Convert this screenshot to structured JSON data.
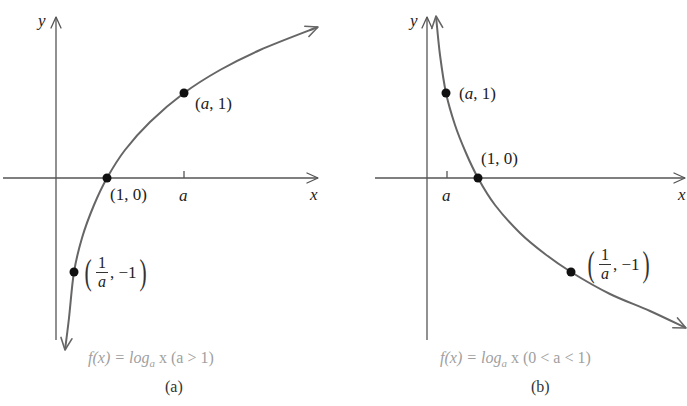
{
  "chart_data": [
    {
      "type": "line",
      "id": "a",
      "title": "f(x) = log_a x (a > 1)",
      "panel_label": "(a)",
      "xlabel": "x",
      "ylabel": "y",
      "x_tick_labels": [
        "a"
      ],
      "grid": false,
      "series": [
        {
          "name": "f(x) = log_a x",
          "description": "increasing logarithmic curve",
          "key_points": [
            {
              "label": "(1/a, -1)",
              "x": "1/a",
              "y": -1
            },
            {
              "label": "(1, 0)",
              "x": 1,
              "y": 0
            },
            {
              "label": "(a, 1)",
              "x": "a",
              "y": 1
            }
          ]
        }
      ]
    },
    {
      "type": "line",
      "id": "b",
      "title": "f(x) = log_a x (0 < a < 1)",
      "panel_label": "(b)",
      "xlabel": "x",
      "ylabel": "y",
      "x_tick_labels": [
        "a"
      ],
      "grid": false,
      "series": [
        {
          "name": "f(x) = log_a x",
          "description": "decreasing logarithmic curve",
          "key_points": [
            {
              "label": "(a, 1)",
              "x": "a",
              "y": 1
            },
            {
              "label": "(1, 0)",
              "x": 1,
              "y": 0
            },
            {
              "label": "(1/a, -1)",
              "x": "1/a",
              "y": -1
            }
          ]
        }
      ]
    }
  ],
  "labels": {
    "y": "y",
    "x": "x",
    "a": "a",
    "one": "1",
    "pt_a1": "(a, 1)",
    "pt_10": "(1, 0)",
    "pt_inv_suffix": ", −1",
    "paren_open": "(",
    "paren_close": ")"
  },
  "captions": {
    "a_prefix": "f(x) = log",
    "a_sub": "a",
    "a_suffix": " x (a > 1)",
    "b_prefix": "f(x) = log",
    "b_sub": "a",
    "b_suffix": " x (0 < a < 1)",
    "tag_a": "(a)",
    "tag_b": "(b)"
  },
  "colors": {
    "curve": "#666666",
    "axis": "#555555",
    "dot": "#111111",
    "caption": "#a0a0a0"
  },
  "geometry": {
    "a": {
      "x_axis": {
        "x1": 3,
        "x2": 318,
        "y": 178
      },
      "y_axis": {
        "x": 56,
        "y1": 340,
        "y2": 17
      },
      "tick_a": 184,
      "curve_points": [
        [
          65,
          350
        ],
        [
          69,
          318
        ],
        [
          74,
          272
        ],
        [
          82,
          238
        ],
        [
          94,
          205
        ],
        [
          107,
          178
        ],
        [
          125,
          150
        ],
        [
          150,
          122
        ],
        [
          184,
          93
        ],
        [
          220,
          70
        ],
        [
          260,
          50
        ],
        [
          318,
          27
        ]
      ],
      "dots": [
        [
          74,
          272
        ],
        [
          107,
          178
        ],
        [
          184,
          93
        ]
      ]
    },
    "b": {
      "x_axis": {
        "x1": 375,
        "x2": 685,
        "y": 178
      },
      "y_axis": {
        "x": 427,
        "y1": 340,
        "y2": 17
      },
      "tick_a": 447,
      "curve_points": [
        [
          436,
          16
        ],
        [
          440,
          55
        ],
        [
          446,
          93
        ],
        [
          455,
          125
        ],
        [
          466,
          153
        ],
        [
          478,
          178
        ],
        [
          495,
          205
        ],
        [
          520,
          233
        ],
        [
          545,
          254
        ],
        [
          571,
          272
        ],
        [
          610,
          294
        ],
        [
          650,
          311
        ],
        [
          686,
          328
        ]
      ],
      "dots": [
        [
          446,
          93
        ],
        [
          478,
          178
        ],
        [
          571,
          272
        ]
      ]
    }
  }
}
